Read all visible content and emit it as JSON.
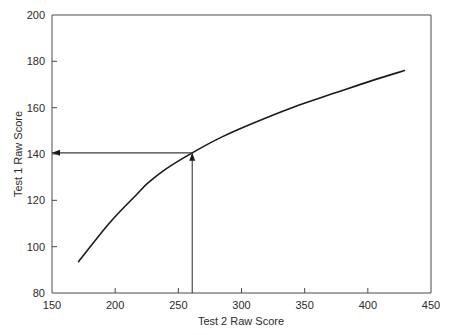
{
  "chart_data": {
    "type": "line",
    "title": "",
    "subtitle": "",
    "xlabel": "Test 2 Raw Score",
    "ylabel": "Test 1 Raw Score",
    "xlim": [
      150,
      450
    ],
    "ylim": [
      80,
      200
    ],
    "xticks": [
      150,
      200,
      250,
      300,
      350,
      400,
      450
    ],
    "yticks": [
      80,
      100,
      120,
      140,
      160,
      180,
      200
    ],
    "xtick_labels": [
      "150",
      "200",
      "250",
      "300",
      "350",
      "400",
      "450"
    ],
    "ytick_labels": [
      "80",
      "100",
      "120",
      "140",
      "160",
      "180",
      "200"
    ],
    "grid": false,
    "legend": null,
    "series": [
      {
        "name": "Score equivalency curve",
        "x": [
          171,
          196,
          217,
          226,
          240,
          261,
          285,
          310,
          340,
          375,
          405,
          429
        ],
        "y": [
          93.5,
          110.5,
          122.5,
          127.5,
          133.5,
          140.5,
          147.5,
          153.5,
          160.0,
          166.5,
          172.0,
          176.0
        ]
      }
    ],
    "annotations": [
      {
        "name": "vertical-reference-arrow",
        "type": "arrow",
        "from_x": 261,
        "from_y": 80,
        "to_x": 261,
        "to_y": 140.5,
        "direction": "up",
        "value_label": "261"
      },
      {
        "name": "horizontal-reference-arrow",
        "type": "arrow",
        "from_x": 261,
        "from_y": 140.5,
        "to_x": 150,
        "to_y": 140.5,
        "direction": "left",
        "value_label": "140"
      }
    ],
    "colors": {
      "curve": "#1a1a1a",
      "axis": "#4a4a4a",
      "annotation": "#3d3d3d",
      "background": "#ffffff",
      "text": "#2b2b2b"
    }
  }
}
